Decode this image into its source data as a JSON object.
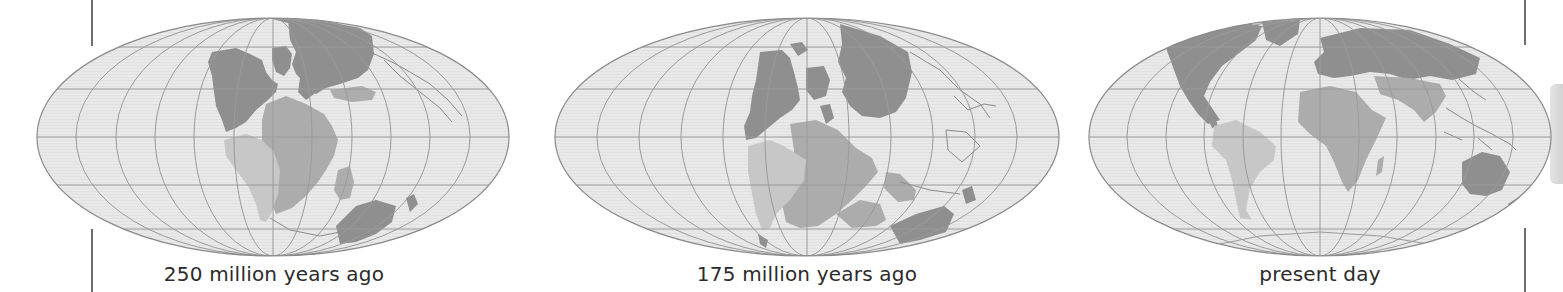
{
  "figure": {
    "colors": {
      "ocean": "#e8e8e8",
      "graticule": "#9a9a9a",
      "outline": "#8a8a8a",
      "land_dark": "#8f8f8f",
      "land_medium": "#acacac",
      "land_light": "#c7c7c7",
      "caption": "#2b2b2b",
      "bars": "#6f6f6f"
    },
    "maps": [
      {
        "id": "map-250",
        "caption": "250 million years ago",
        "center": [
          273,
          137
        ],
        "rx": 236,
        "ry": 119
      },
      {
        "id": "map-175",
        "caption": "175 million years ago",
        "center": [
          807,
          137
        ],
        "rx": 252,
        "ry": 119
      },
      {
        "id": "map-present",
        "caption": "present day",
        "center": [
          1320,
          137
        ],
        "rx": 231,
        "ry": 119
      }
    ]
  }
}
